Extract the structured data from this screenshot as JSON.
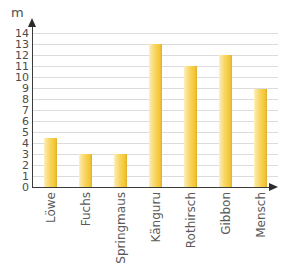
{
  "chart_data": {
    "type": "bar",
    "title": "",
    "subtitle": "",
    "xlabel": "",
    "ylabel": "m",
    "unit": "m",
    "categories": [
      "Löwe",
      "Fuchs",
      "Springmaus",
      "Känguru",
      "Rothirsch",
      "Gibbon",
      "Mensch"
    ],
    "values": [
      4.5,
      3,
      3,
      13,
      11,
      12,
      8.9
    ],
    "series": [
      {
        "name": "Sprungweite",
        "values": [
          4.5,
          3,
          3,
          13,
          11,
          12,
          8.9
        ]
      }
    ],
    "ylim": [
      0,
      14
    ],
    "ytick_labels": [
      "14",
      "13",
      "12",
      "11",
      "10",
      "9",
      "8",
      "7",
      "6",
      "5",
      "4",
      "3",
      "2",
      "1",
      "0"
    ],
    "ytick_values": [
      14,
      13,
      12,
      11,
      10,
      9,
      8,
      7,
      6,
      5,
      4,
      3,
      2,
      1,
      0
    ],
    "ytick_step": 1,
    "grid": true,
    "grid_axis": "y",
    "legend": false,
    "legend_position": "none",
    "annotations": [],
    "colors": {
      "bar_light": "#fdf0c0",
      "bar_mid": "#f8d55f",
      "bar_dark": "#dcae28",
      "gridline": "#dcdcdc",
      "axis": "#3a3a3a",
      "tick_text": "#4d4d4d",
      "category_text": "#5a5a5a",
      "background": "#ffffff"
    }
  }
}
